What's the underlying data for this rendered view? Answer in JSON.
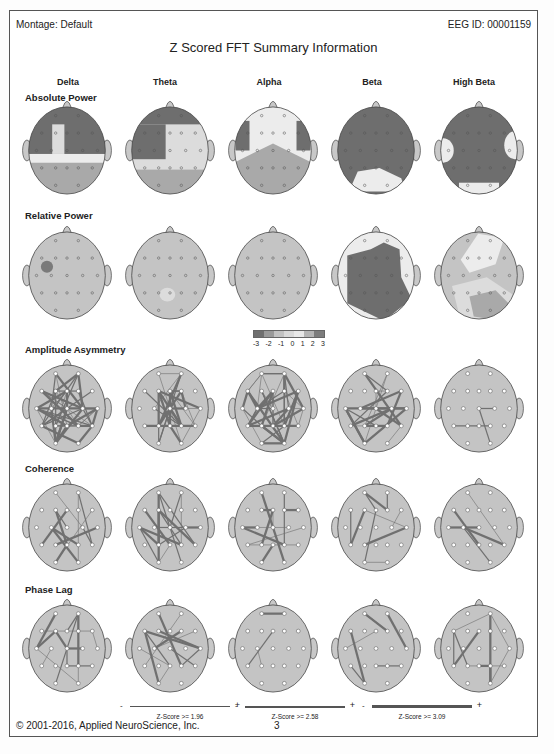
{
  "header": {
    "montage_label": "Montage:  Default",
    "eeg_id_label": "EEG ID:  00001159",
    "title": "Z Scored FFT Summary Information"
  },
  "bands": [
    "Delta",
    "Theta",
    "Alpha",
    "Beta",
    "High Beta"
  ],
  "sections": [
    {
      "label": "Absolute Power",
      "type": "topomap"
    },
    {
      "label": "Relative Power",
      "type": "topomap"
    },
    {
      "label": "Amplitude Asymmetry",
      "type": "connectivity"
    },
    {
      "label": "Coherence",
      "type": "connectivity"
    },
    {
      "label": "Phase Lag",
      "type": "connectivity"
    }
  ],
  "color_scale": {
    "ticks": [
      "-3",
      "-2",
      "-1",
      "0",
      "1",
      "2",
      "3"
    ],
    "colors": [
      "#6f6f6f",
      "#9a9a9a",
      "#c2c2c2",
      "#d9d9d9",
      "#e8e8e8",
      "#b5b5b5",
      "#7d7d7d"
    ]
  },
  "z_legends": [
    {
      "minus": "-",
      "plus": "+",
      "label": "Z-Score >= 1.96",
      "thickness": 1
    },
    {
      "minus": "-",
      "plus": "+",
      "label": "Z-Score >= 2.58",
      "thickness": 1.5
    },
    {
      "minus": "-",
      "plus": "+",
      "label": "Z-Score >= 3.09",
      "thickness": 3
    }
  ],
  "footer": {
    "copyright": "© 2001-2016, Applied NeuroScience, Inc.",
    "page_number": "3"
  },
  "chart_data": {
    "type": "heatmap",
    "title": "Z Scored FFT Summary Information",
    "columns": [
      "Delta",
      "Theta",
      "Alpha",
      "Beta",
      "High Beta"
    ],
    "rows": [
      "Absolute Power",
      "Relative Power",
      "Amplitude Asymmetry",
      "Coherence",
      "Phase Lag"
    ],
    "colorbar": {
      "range": [
        -3,
        3
      ],
      "ticks": [
        -3,
        -2,
        -1,
        0,
        1,
        2,
        3
      ]
    },
    "topomap_patterns": {
      "Absolute Power": {
        "Delta": "frontal/central elevated (~+2 to +3), posterior near 0, central midline notch lower",
        "Theta": "left/frontal elevated (~+2), right-central and posterior near 0",
        "Alpha": "mostly near 0 to +1, left and right frontal patches elevated (~+2)",
        "Beta": "globally elevated (~+3), posterior region near 0",
        "High Beta": "globally elevated (~+3), temporal lateral and occipital near 0"
      },
      "Relative Power": {
        "Delta": "near 0 globally, small left-central patch ~+2",
        "Theta": "near 0 globally",
        "Alpha": "near 0 globally",
        "Beta": "central/posterior elevated (~+2 to +3), periphery near 0",
        "High Beta": "near 0 with right-posterior patch elevated (~+2)"
      }
    },
    "z_thresholds": [
      1.96,
      2.58,
      3.09
    ]
  }
}
